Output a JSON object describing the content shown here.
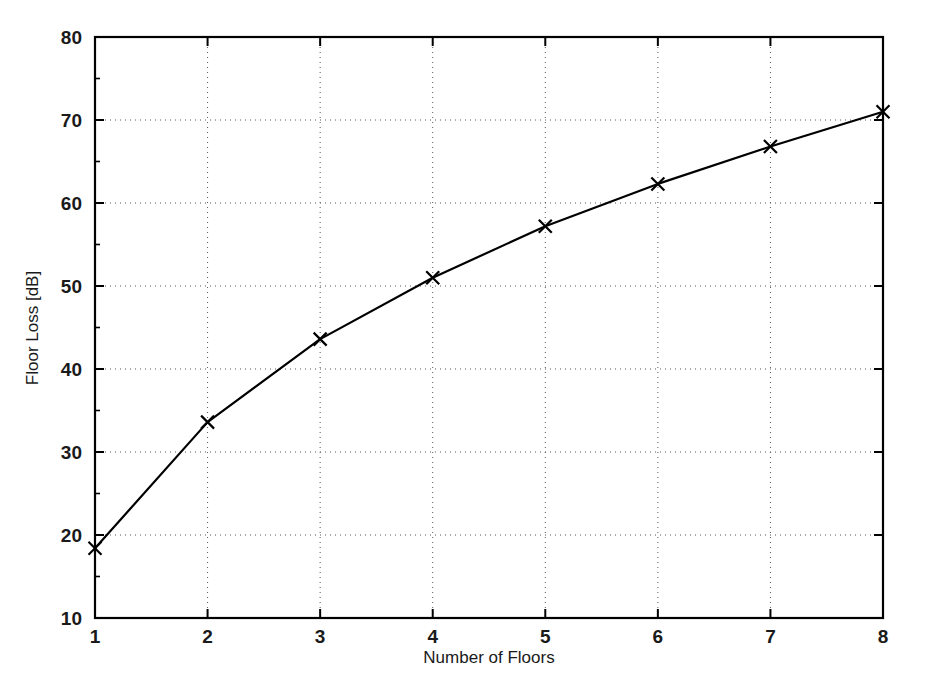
{
  "chart_data": {
    "type": "line",
    "title": "",
    "xlabel": "Number of Floors",
    "ylabel": "Floor Loss [dB]",
    "x": [
      1,
      2,
      3,
      4,
      5,
      6,
      7,
      8
    ],
    "values": [
      18.4,
      33.6,
      43.6,
      51.0,
      57.2,
      62.3,
      66.8,
      71.0
    ],
    "series": [
      {
        "name": "Floor Loss",
        "x": [
          1,
          2,
          3,
          4,
          5,
          6,
          7,
          8
        ],
        "values": [
          18.4,
          33.6,
          43.6,
          51.0,
          57.2,
          62.3,
          66.8,
          71.0
        ],
        "marker": "x",
        "line_color": "#000000",
        "marker_color": "#000000"
      }
    ],
    "xlim": [
      1,
      8
    ],
    "ylim": [
      10,
      80
    ],
    "xticks": [
      1,
      2,
      3,
      4,
      5,
      6,
      7,
      8
    ],
    "xtick_labels": [
      "1",
      "2",
      "3",
      "4",
      "5",
      "6",
      "7",
      "8"
    ],
    "yticks": [
      10,
      20,
      30,
      40,
      50,
      60,
      70,
      80
    ],
    "ytick_labels": [
      "10",
      "20",
      "30",
      "40",
      "50",
      "60",
      "70",
      "80"
    ],
    "grid": true,
    "grid_style": "dotted",
    "grid_color": "#555555",
    "legend": null,
    "legend_position": "none",
    "background_color": "#ffffff",
    "axis_color": "#000000",
    "annotations": []
  },
  "figure": {
    "axis_label_x": "Number of Floors",
    "axis_label_y": "Floor Loss [dB]"
  }
}
